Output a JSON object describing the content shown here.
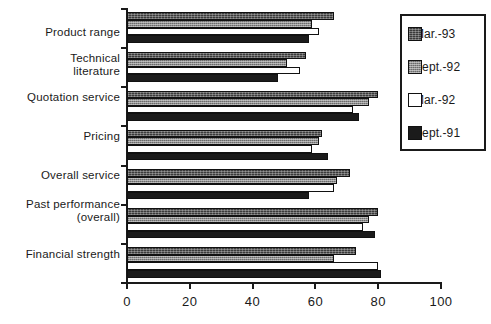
{
  "chart_data": {
    "type": "bar",
    "orientation": "horizontal",
    "title": "",
    "xlabel": "",
    "ylabel": "",
    "xlim": [
      0,
      100
    ],
    "xticks": [
      0,
      20,
      40,
      60,
      80,
      100
    ],
    "xticklabels": [
      "0",
      "20",
      "40",
      "60",
      "80",
      "100"
    ],
    "grid": false,
    "legend_position": "right",
    "categories": [
      "Product range",
      "Technical literature",
      "Quotation service",
      "Pricing",
      "Overall service",
      "Past performance (overall)",
      "Financial strength"
    ],
    "series": [
      {
        "name": "Mar.-93",
        "color": "#3a3a3a",
        "pattern": "dark-hatch",
        "values": [
          66,
          57,
          80,
          62,
          71,
          80,
          73
        ]
      },
      {
        "name": "Sept.-92",
        "color": "#8d8d8d",
        "pattern": "light-dots",
        "values": [
          59,
          51,
          77,
          61,
          67,
          77,
          66
        ]
      },
      {
        "name": "Mar.-92",
        "color": "#ffffff",
        "pattern": "solid-white",
        "values": [
          61,
          55,
          72,
          59,
          66,
          75,
          80
        ]
      },
      {
        "name": "Sept.-91",
        "color": "#1b1b1b",
        "pattern": "solid-black",
        "values": [
          58,
          48,
          74,
          64,
          58,
          79,
          81
        ]
      }
    ]
  },
  "categories_display": [
    {
      "line1": "Product range",
      "line2": ""
    },
    {
      "line1": "Technical",
      "line2": "literature"
    },
    {
      "line1": "Quotation service",
      "line2": ""
    },
    {
      "line1": "Pricing",
      "line2": ""
    },
    {
      "line1": "Overall service",
      "line2": ""
    },
    {
      "line1": "Past performance",
      "line2": "(overall)"
    },
    {
      "line1": "Financial strength",
      "line2": ""
    }
  ],
  "axis": {
    "tick_labels": [
      "0",
      "20",
      "40",
      "60",
      "80",
      "100"
    ]
  },
  "legend": {
    "items": [
      {
        "label": "Mar.-93"
      },
      {
        "label": "Sept.-92"
      },
      {
        "label": "Mar.-92"
      },
      {
        "label": "Sept.-91"
      }
    ]
  }
}
